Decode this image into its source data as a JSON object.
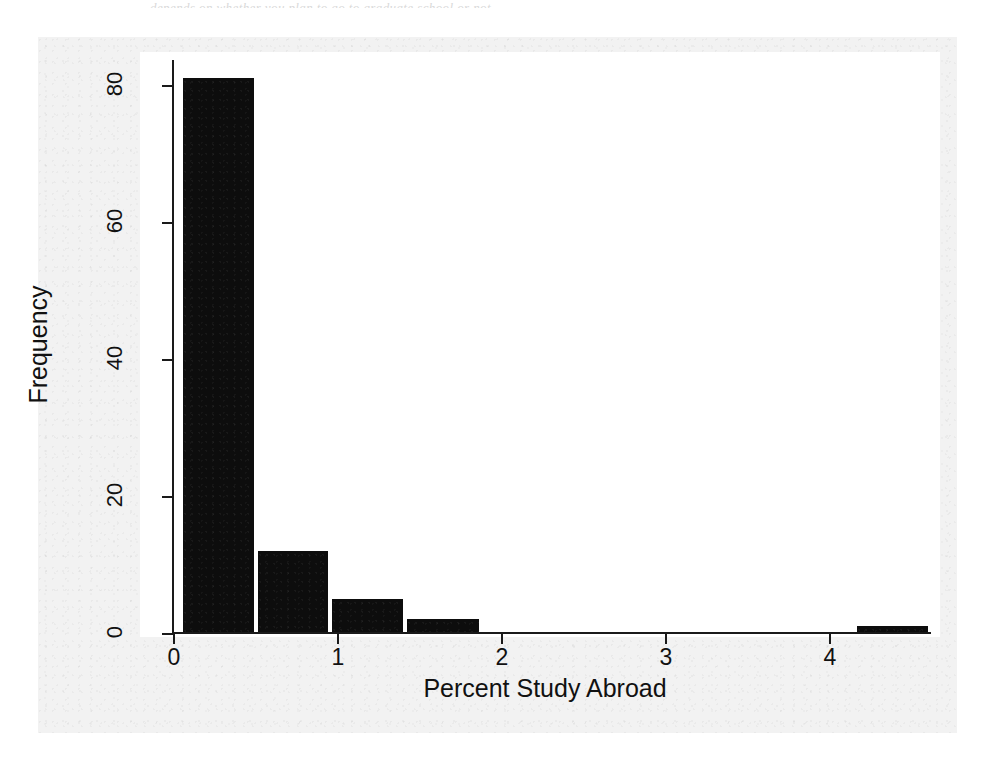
{
  "page": {
    "cut_header_text": "depends on whether you plan to go to graduate school or not"
  },
  "chart_data": {
    "type": "bar",
    "subtype": "histogram",
    "title": "",
    "xlabel": "Percent Study Abroad",
    "ylabel": "Frequency",
    "xlim": [
      -0.1,
      4.65
    ],
    "ylim": [
      0,
      83
    ],
    "grid": false,
    "legend": false,
    "bar_color": "#0d0d0d",
    "background_color": "#ffffff",
    "axis_color": "#1a1a1a",
    "xticks": [
      0,
      1,
      2,
      3,
      4
    ],
    "xtick_labels": [
      "0",
      "1",
      "2",
      "3",
      "4"
    ],
    "yticks": [
      0,
      20,
      40,
      60,
      80
    ],
    "ytick_labels": [
      "0",
      "20",
      "40",
      "60",
      "80"
    ],
    "bin_edges": [
      0.04,
      0.5,
      0.95,
      1.41,
      1.87,
      2.33,
      2.78,
      3.24,
      3.7,
      4.15,
      4.61
    ],
    "bins": [
      {
        "x0": 0.04,
        "x1": 0.5,
        "count": 81
      },
      {
        "x0": 0.5,
        "x1": 0.95,
        "count": 12
      },
      {
        "x0": 0.95,
        "x1": 1.41,
        "count": 5
      },
      {
        "x0": 1.41,
        "x1": 1.87,
        "count": 2
      },
      {
        "x0": 1.87,
        "x1": 2.33,
        "count": 0
      },
      {
        "x0": 2.33,
        "x1": 2.78,
        "count": 0
      },
      {
        "x0": 2.78,
        "x1": 3.24,
        "count": 0
      },
      {
        "x0": 3.24,
        "x1": 3.7,
        "count": 0
      },
      {
        "x0": 3.7,
        "x1": 4.15,
        "count": 0
      },
      {
        "x0": 4.15,
        "x1": 4.61,
        "count": 1
      }
    ],
    "categories": [
      "0.04-0.5",
      "0.5-0.95",
      "0.95-1.41",
      "1.41-1.87",
      "1.87-2.33",
      "2.33-2.78",
      "2.78-3.24",
      "3.24-3.70",
      "3.70-4.15",
      "4.15-4.61"
    ],
    "values": [
      81,
      12,
      5,
      2,
      0,
      0,
      0,
      0,
      0,
      1
    ]
  }
}
